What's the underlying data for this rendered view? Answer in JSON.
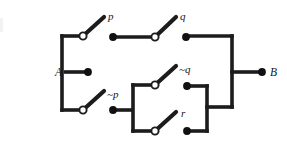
{
  "figure": {
    "type": "switching-circuit-diagram",
    "background_color": "#ffffff",
    "wire_color": "#1c1c1c",
    "contact_color": "#111111",
    "pivot_fill": "#ffffff"
  },
  "terminals": [
    {
      "id": "A",
      "label": "A",
      "x": 88,
      "y": 72,
      "label_x": 62,
      "label_y": 76
    },
    {
      "id": "B",
      "label": "B",
      "x": 262,
      "y": 72,
      "label_x": 270,
      "label_y": 76
    }
  ],
  "switches": [
    {
      "id": "p",
      "label": "p",
      "negated": false,
      "branch": "top",
      "pivot_x": 83,
      "pivot_y": 36,
      "lever_tip_x": 104,
      "lever_tip_y": 17,
      "contact_x": 113,
      "contact_y": 37,
      "label_x": 108,
      "label_y": 20
    },
    {
      "id": "q",
      "label": "q",
      "negated": false,
      "branch": "top",
      "pivot_x": 155,
      "pivot_y": 37,
      "lever_tip_x": 176,
      "lever_tip_y": 17,
      "contact_x": 186,
      "contact_y": 37,
      "label_x": 180,
      "label_y": 20
    },
    {
      "id": "not-p",
      "label": "~p",
      "negated": true,
      "branch": "bottom",
      "pivot_x": 83,
      "pivot_y": 110,
      "lever_tip_x": 104,
      "lever_tip_y": 91,
      "contact_x": 113,
      "contact_y": 110,
      "label_x": 107,
      "label_y": 98
    },
    {
      "id": "not-q",
      "label": "~q",
      "negated": true,
      "branch": "inner-top",
      "pivot_x": 155,
      "pivot_y": 85,
      "lever_tip_x": 176,
      "lever_tip_y": 66,
      "contact_x": 187,
      "contact_y": 86,
      "label_x": 179,
      "label_y": 73
    },
    {
      "id": "r",
      "label": "r",
      "negated": false,
      "branch": "inner-bottom",
      "pivot_x": 155,
      "pivot_y": 131,
      "lever_tip_x": 176,
      "lever_tip_y": 112,
      "contact_x": 187,
      "contact_y": 131,
      "label_x": 181,
      "label_y": 117
    }
  ],
  "nodes": {
    "left_bus_x": 62,
    "right_bus_x": 232,
    "top_rail_y": 36,
    "bottom_rail_y": 110,
    "mid_y": 72,
    "inner_left_x": 133,
    "inner_right_x": 207,
    "inner_top_y": 85,
    "inner_bottom_y": 131,
    "inner_join_y": 107
  },
  "geometry": {
    "width": 287,
    "height": 147,
    "pivot_radius": 3.6,
    "contact_radius": 3.9,
    "terminal_radius": 3.9,
    "wire_width": 3.6,
    "lever_width": 4.2
  }
}
